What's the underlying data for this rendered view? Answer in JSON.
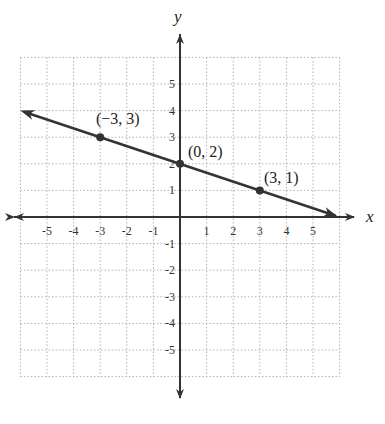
{
  "chart_data": {
    "type": "line",
    "title": "",
    "xlabel": "x",
    "ylabel": "y",
    "xlim": [
      -6,
      6
    ],
    "ylim": [
      -6,
      6
    ],
    "grid": true,
    "grid_style": "dotted",
    "x_ticks": [
      -5,
      -4,
      -3,
      -2,
      -1,
      1,
      2,
      3,
      4,
      5
    ],
    "y_ticks": [
      -5,
      -4,
      -3,
      -2,
      -1,
      1,
      2,
      3,
      4,
      5
    ],
    "x_tick_labels": [
      "-5",
      "-4",
      "-3",
      "-2",
      "-1",
      "1",
      "2",
      "3",
      "4",
      "5"
    ],
    "y_tick_labels": [
      "-5",
      "-4",
      "-3",
      "-2",
      "-1",
      "1",
      "2",
      "3",
      "4",
      "5"
    ],
    "series": [
      {
        "name": "line",
        "equation": "y = -x/3 + 2",
        "slope": -0.3333,
        "intercept": 2,
        "x": [
          -6,
          6
        ],
        "y": [
          4,
          0
        ],
        "arrows_both_ends": true
      }
    ],
    "points": [
      {
        "x": -3,
        "y": 3,
        "label": "(−3, 3)"
      },
      {
        "x": 0,
        "y": 2,
        "label": "(0, 2)"
      },
      {
        "x": 3,
        "y": 1,
        "label": "(3, 1)"
      }
    ],
    "colors": {
      "line": "#333333",
      "grid": "#b0b0b0",
      "axis": "#333333"
    }
  },
  "labels": {
    "x_axis": "x",
    "y_axis": "y",
    "point_a": "(−3, 3)",
    "point_b": "(0, 2)",
    "point_c": "(3, 1)"
  }
}
